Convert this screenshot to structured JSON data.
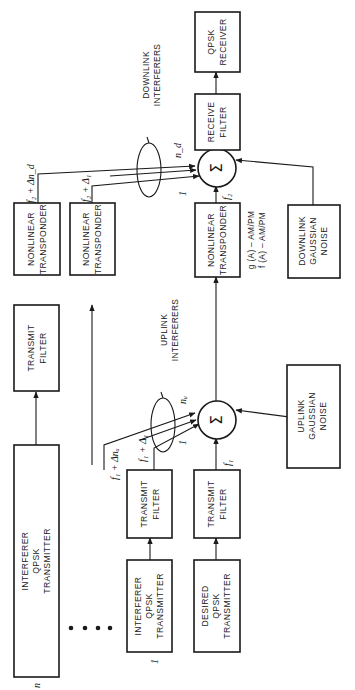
{
  "diagram": {
    "orientation": "rotated -90 degrees (signal flows bottom to top)",
    "blocks": {
      "interferer_n_tx": {
        "lines": [
          "INTERFERER",
          "QPSK",
          "TRANSMITTER"
        ],
        "index": "n"
      },
      "interferer_1_tx": {
        "lines": [
          "INTERFERER",
          "QPSK",
          "TRANSMITTER"
        ],
        "index": "1"
      },
      "desired_tx": {
        "lines": [
          "DESIRED",
          "QPSK",
          "TRANSMITTER"
        ]
      },
      "tx_filter_n": {
        "lines": [
          "TRANSMIT",
          "FILTER"
        ]
      },
      "tx_filter_1": {
        "lines": [
          "TRANSMIT",
          "FILTER"
        ]
      },
      "tx_filter_desired": {
        "lines": [
          "TRANSMIT",
          "FILTER"
        ]
      },
      "uplink_noise": {
        "lines": [
          "UPLINK",
          "GAUSSIAN",
          "NOISE"
        ]
      },
      "transponder_n": {
        "lines": [
          "NONLINEAR",
          "TRANSPONDER"
        ]
      },
      "transponder_1": {
        "lines": [
          "NONLINEAR",
          "TRANSPONDER"
        ]
      },
      "transponder_desired": {
        "lines": [
          "NONLINEAR",
          "TRANSPONDER"
        ]
      },
      "downlink_noise": {
        "lines": [
          "DOWNLINK",
          "GAUSSIAN",
          "NOISE"
        ]
      },
      "receive_filter": {
        "lines": [
          "RECEIVE",
          "FILTER"
        ]
      },
      "qpsk_receiver": {
        "lines": [
          "QPSK",
          "RECEIVER"
        ]
      }
    },
    "summers": {
      "uplink": {
        "symbol": "Σ"
      },
      "downlink": {
        "symbol": "Σ"
      }
    },
    "annotations": {
      "uplink_interferers": [
        "UPLINK",
        "INTERFERERS"
      ],
      "downlink_interferers": [
        "DOWNLINK",
        "INTERFERERS"
      ],
      "nonlinearity": [
        "g (A) – AM/PM",
        "f (A) – AM/PM"
      ],
      "ellipsis": "• • • •"
    },
    "signal_labels": {
      "f1": "f₁",
      "f1_delta1": "f₁ + Δ₁",
      "f1_delta_nu": "f₁ + Δnᵤ",
      "f2": "f₂",
      "f2_delta1": "f₂ + Δ₁",
      "f2_delta_nd": "f₂ + Δn_d",
      "nu": "nᵤ",
      "nd": "n_d",
      "one_up": "1",
      "one_down": "1"
    }
  }
}
